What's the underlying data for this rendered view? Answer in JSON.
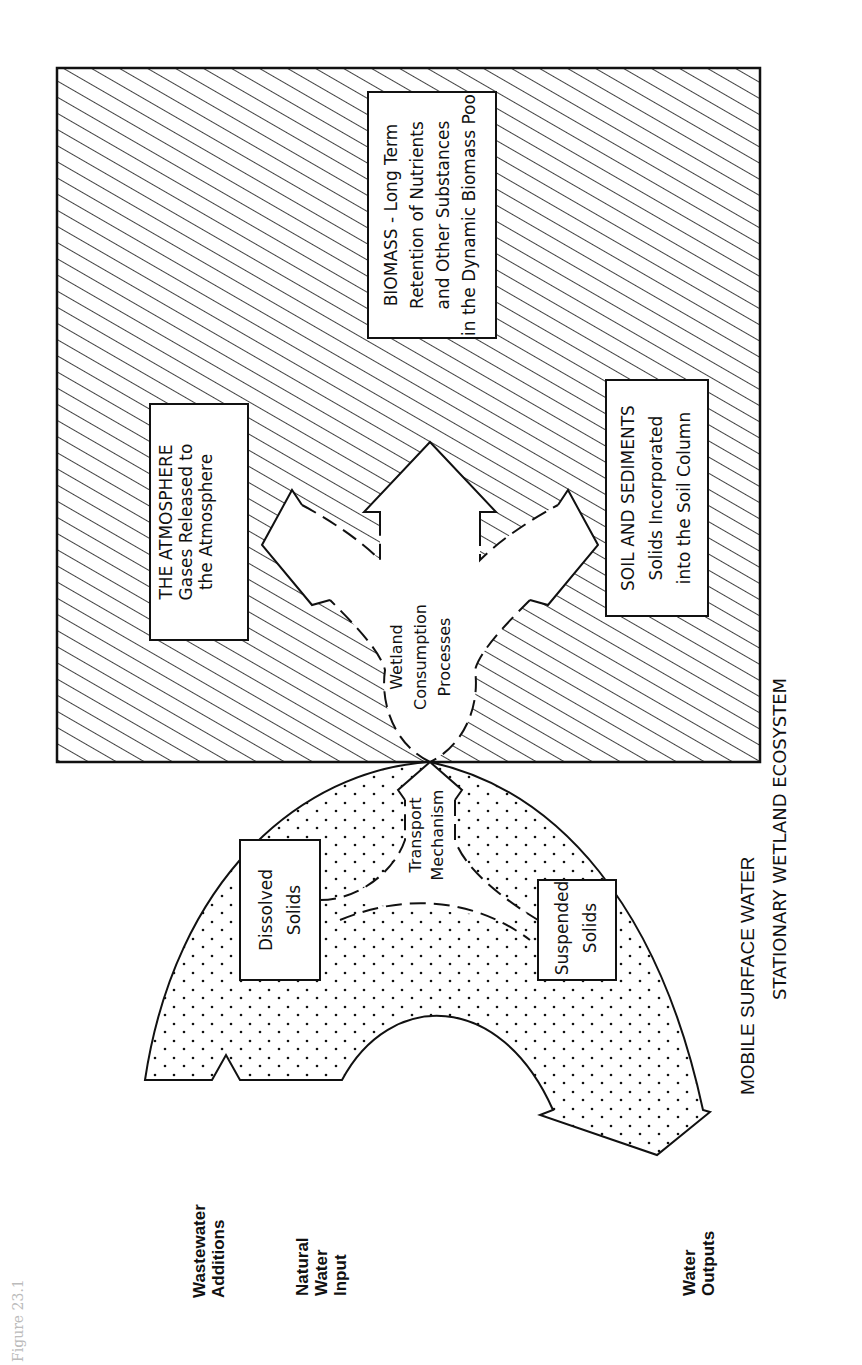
{
  "figure": {
    "caption": "Figure 23.1",
    "orientation": "rotated 90° counter-clockwise"
  },
  "regions": {
    "stationary": {
      "label": "STATIONARY WETLAND ECOSYSTEM",
      "fill": "diagonal-hatch"
    },
    "mobile": {
      "label": "MOBILE SURFACE WATER",
      "fill": "stipple-dots"
    }
  },
  "sinks": {
    "atmosphere": {
      "title": "THE ATMOSPHERE",
      "line1": "Gases Released to",
      "line2": "the Atmosphere"
    },
    "biomass": {
      "title": "BIOMASS - Long Term",
      "line1": "Retention of Nutrients",
      "line2": "and Other Substances",
      "line3": "in the Dynamic Biomass Pool"
    },
    "soil": {
      "title": "SOIL AND SEDIMENTS",
      "line1": "Solids Incorporated",
      "line2": "into the Soil Column"
    }
  },
  "processes": {
    "consumption": {
      "line1": "Wetland",
      "line2": "Consumption",
      "line3": "Processes"
    },
    "transport": {
      "line1": "Transport",
      "line2": "Mechanism"
    }
  },
  "solids": {
    "dissolved": {
      "line1": "Dissolved",
      "line2": "Solids"
    },
    "suspended": {
      "line1": "Suspended",
      "line2": "Solids"
    }
  },
  "flows": {
    "wastewater": {
      "line1": "Wastewater",
      "line2": "Additions"
    },
    "natural": {
      "line1": "Natural",
      "line2": "Water",
      "line3": "Input"
    },
    "outputs": {
      "line1": "Water",
      "line2": "Outputs"
    }
  }
}
